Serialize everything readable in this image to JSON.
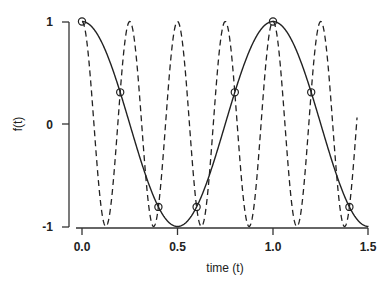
{
  "chart_data": {
    "type": "line",
    "title": "",
    "xlabel": "time (t)",
    "ylabel": "f(t)",
    "xlim": [
      0,
      1.5
    ],
    "ylim": [
      -1,
      1
    ],
    "grid": false,
    "legend": null,
    "x_ticks": [
      "0.0",
      "0.5",
      "1.0",
      "1.5"
    ],
    "y_ticks": [
      "-1",
      "0",
      "1"
    ],
    "series": [
      {
        "name": "cos(2πt)",
        "style": "solid",
        "function": "cos(2*pi*1*t)",
        "frequency": 1,
        "t_range": [
          0,
          1.5
        ],
        "x": [
          0.0,
          0.1,
          0.2,
          0.3,
          0.4,
          0.5,
          0.6,
          0.7,
          0.8,
          0.9,
          1.0,
          1.1,
          1.2,
          1.3,
          1.4,
          1.5
        ],
        "values": [
          1.0,
          0.809,
          0.309,
          -0.309,
          -0.809,
          -1.0,
          -0.809,
          -0.309,
          0.309,
          0.809,
          1.0,
          0.809,
          0.309,
          -0.309,
          -0.809,
          -1.0
        ]
      },
      {
        "name": "cos(8πt)",
        "style": "dashed",
        "function": "cos(2*pi*4*t)",
        "frequency": 4,
        "t_range": [
          0,
          1.44
        ],
        "x": [
          0.0,
          0.125,
          0.25,
          0.375,
          0.5,
          0.625,
          0.75,
          0.875,
          1.0,
          1.125,
          1.25,
          1.375,
          1.44
        ],
        "values": [
          1.0,
          -1.0,
          1.0,
          -1.0,
          1.0,
          -1.0,
          1.0,
          -1.0,
          1.0,
          -1.0,
          1.0,
          -1.0,
          0.37
        ]
      },
      {
        "name": "samples",
        "style": "open-circle",
        "x": [
          0.0,
          0.2,
          0.4,
          0.6,
          0.8,
          1.0,
          1.2,
          1.4
        ],
        "values": [
          1.0,
          0.309,
          -0.809,
          -0.809,
          0.309,
          1.0,
          0.309,
          -0.809
        ]
      }
    ]
  }
}
